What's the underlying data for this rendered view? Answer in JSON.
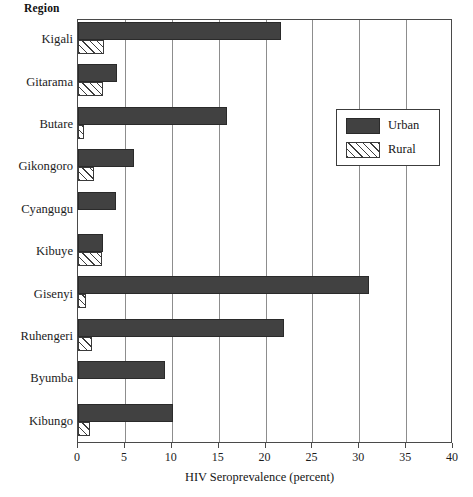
{
  "title_label": "Region",
  "legend": {
    "position": "upper-right-inside",
    "entries": [
      {
        "label": "Urban",
        "swatch": "solid-dark-fill",
        "color": "#414141"
      },
      {
        "label": "Rural",
        "swatch": "diagonal-hatch-fill",
        "color": "#ffffff"
      }
    ]
  },
  "chart_data": {
    "type": "bar",
    "orientation": "horizontal",
    "title": "",
    "xlabel": "HIV Seroprevalence (percent)",
    "ylabel": "Region",
    "xlim": [
      0,
      40
    ],
    "xticks": [
      0,
      5,
      10,
      15,
      20,
      25,
      30,
      35,
      40
    ],
    "xticklabels": [
      "0",
      "5",
      "10",
      "15",
      "20",
      "25",
      "30",
      "35",
      "40"
    ],
    "grid": "vertical-only",
    "categories": [
      "Kigali",
      "Gitarama",
      "Butare",
      "Gikongoro",
      "Cyangugu",
      "Kibuye",
      "Gisenyi",
      "Ruhengeri",
      "Byumba",
      "Kibungo"
    ],
    "series": [
      {
        "name": "Urban",
        "color": "#414141",
        "values": [
          21.6,
          4.2,
          15.9,
          6.0,
          4.1,
          2.7,
          31.0,
          22.0,
          9.3,
          10.1
        ]
      },
      {
        "name": "Rural",
        "color": "#ffffff",
        "values": [
          2.8,
          2.7,
          0.6,
          1.7,
          0.0,
          2.6,
          0.9,
          1.5,
          0.0,
          1.3
        ]
      }
    ]
  }
}
